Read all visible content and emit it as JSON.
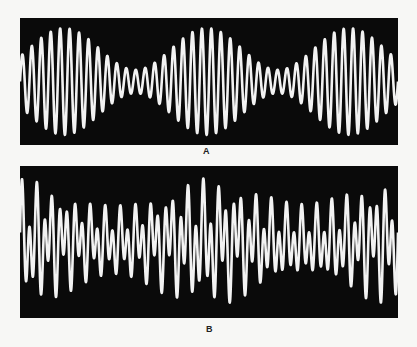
{
  "figure": {
    "panels": [
      {
        "id": "A",
        "label": "A",
        "description": "Amplitude-modulated waveform showing beats",
        "background": "#0a0a0a",
        "trace_color": "#f2f2f2",
        "carrier_cycles": 40,
        "envelope_cycles": 2.65,
        "envelope_phase": 1.2,
        "min_amplitude": 0.22,
        "max_amplitude": 1.0
      },
      {
        "id": "B",
        "label": "B",
        "description": "Complex waveform with alternating peak heights and slow modulation",
        "background": "#0a0a0a",
        "trace_color": "#f2f2f2",
        "carrier_cycles": 50,
        "envelope_cycles": 2.0,
        "min_amplitude": 0.6,
        "max_amplitude": 1.0
      }
    ]
  }
}
